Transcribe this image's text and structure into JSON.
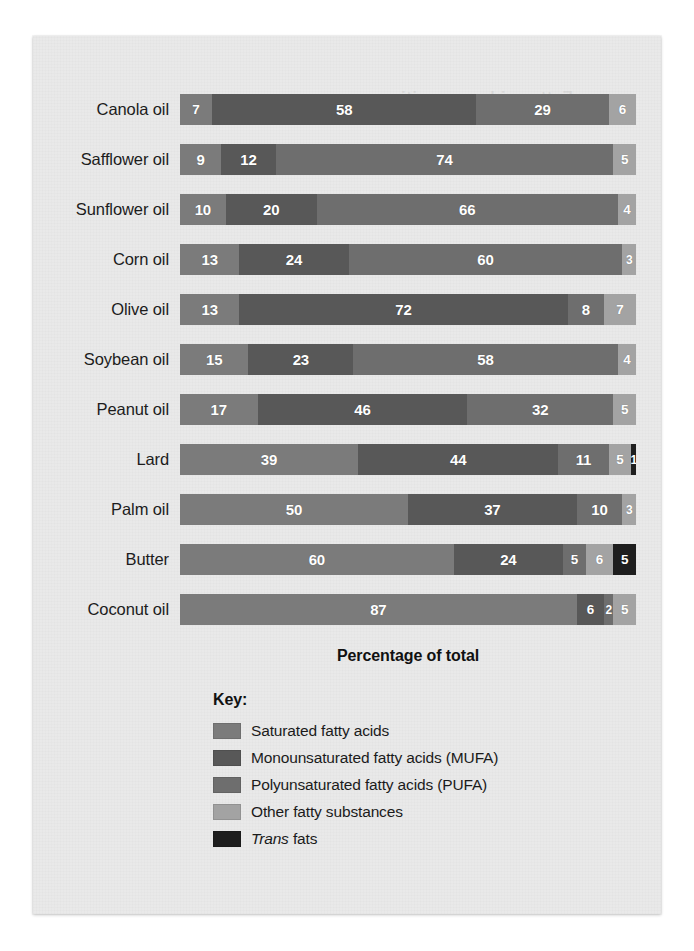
{
  "card": {
    "bleed_through_text": "Fatty acid composition"
  },
  "axis": {
    "caption": "Percentage of total"
  },
  "legend": {
    "title": "Key:",
    "items": [
      {
        "label": "Saturated fatty acids",
        "color": "#7b7b7b",
        "key": "saturated"
      },
      {
        "label": "Monounsaturated fatty acids (MUFA)",
        "color": "#585858",
        "key": "mufa"
      },
      {
        "label": "Polyunsaturated fatty acids (PUFA)",
        "color": "#6e6e6e",
        "key": "pufa"
      },
      {
        "label": "Other fatty substances",
        "color": "#a3a3a3",
        "key": "other"
      },
      {
        "label": "Trans fats",
        "color": "#1e1e1e",
        "key": "trans",
        "italic_first_word": "Trans"
      }
    ]
  },
  "chart_data": {
    "type": "bar",
    "orientation": "horizontal",
    "stacked": true,
    "title": "",
    "xlabel": "Percentage of total",
    "ylabel": "",
    "xlim": [
      0,
      100
    ],
    "grid": false,
    "legend_position": "bottom-left",
    "value_labels": true,
    "categories": [
      "Canola oil",
      "Safflower oil",
      "Sunflower oil",
      "Corn oil",
      "Olive oil",
      "Soybean oil",
      "Peanut oil",
      "Lard",
      "Palm oil",
      "Butter",
      "Coconut oil"
    ],
    "series": [
      {
        "name": "Saturated fatty acids",
        "color": "#7b7b7b",
        "values": [
          7,
          9,
          10,
          13,
          13,
          15,
          17,
          39,
          50,
          60,
          87
        ]
      },
      {
        "name": "Monounsaturated fatty acids (MUFA)",
        "color": "#585858",
        "values": [
          58,
          12,
          20,
          24,
          72,
          23,
          46,
          44,
          37,
          24,
          6
        ]
      },
      {
        "name": "Polyunsaturated fatty acids (PUFA)",
        "color": "#6e6e6e",
        "values": [
          29,
          74,
          66,
          60,
          8,
          58,
          32,
          11,
          10,
          5,
          2
        ]
      },
      {
        "name": "Other fatty substances",
        "color": "#a3a3a3",
        "values": [
          6,
          5,
          4,
          3,
          7,
          4,
          5,
          5,
          3,
          6,
          5
        ]
      },
      {
        "name": "Trans fats",
        "color": "#1e1e1e",
        "values": [
          0,
          0,
          0,
          0,
          0,
          0,
          0,
          1,
          0,
          5,
          0
        ]
      }
    ],
    "rows": [
      {
        "label": "Canola oil",
        "segments": [
          {
            "series": "saturated",
            "value": 7
          },
          {
            "series": "mufa",
            "value": 58
          },
          {
            "series": "pufa",
            "value": 29
          },
          {
            "series": "other",
            "value": 6
          }
        ]
      },
      {
        "label": "Safflower oil",
        "segments": [
          {
            "series": "saturated",
            "value": 9
          },
          {
            "series": "mufa",
            "value": 12
          },
          {
            "series": "pufa",
            "value": 74
          },
          {
            "series": "other",
            "value": 5
          }
        ]
      },
      {
        "label": "Sunflower oil",
        "segments": [
          {
            "series": "saturated",
            "value": 10
          },
          {
            "series": "mufa",
            "value": 20
          },
          {
            "series": "pufa",
            "value": 66
          },
          {
            "series": "other",
            "value": 4
          }
        ]
      },
      {
        "label": "Corn oil",
        "segments": [
          {
            "series": "saturated",
            "value": 13
          },
          {
            "series": "mufa",
            "value": 24
          },
          {
            "series": "pufa",
            "value": 60
          },
          {
            "series": "other",
            "value": 3
          }
        ]
      },
      {
        "label": "Olive oil",
        "segments": [
          {
            "series": "saturated",
            "value": 13
          },
          {
            "series": "mufa",
            "value": 72
          },
          {
            "series": "pufa",
            "value": 8
          },
          {
            "series": "other",
            "value": 7
          }
        ]
      },
      {
        "label": "Soybean oil",
        "segments": [
          {
            "series": "saturated",
            "value": 15
          },
          {
            "series": "mufa",
            "value": 23
          },
          {
            "series": "pufa",
            "value": 58
          },
          {
            "series": "other",
            "value": 4
          }
        ]
      },
      {
        "label": "Peanut oil",
        "segments": [
          {
            "series": "saturated",
            "value": 17
          },
          {
            "series": "mufa",
            "value": 46
          },
          {
            "series": "pufa",
            "value": 32
          },
          {
            "series": "other",
            "value": 5
          }
        ]
      },
      {
        "label": "Lard",
        "segments": [
          {
            "series": "saturated",
            "value": 39
          },
          {
            "series": "mufa",
            "value": 44
          },
          {
            "series": "pufa",
            "value": 11
          },
          {
            "series": "other",
            "value": 5
          },
          {
            "series": "trans",
            "value": 1
          }
        ]
      },
      {
        "label": "Palm oil",
        "segments": [
          {
            "series": "saturated",
            "value": 50
          },
          {
            "series": "mufa",
            "value": 37
          },
          {
            "series": "pufa",
            "value": 10
          },
          {
            "series": "other",
            "value": 3
          }
        ]
      },
      {
        "label": "Butter",
        "segments": [
          {
            "series": "saturated",
            "value": 60
          },
          {
            "series": "mufa",
            "value": 24
          },
          {
            "series": "pufa",
            "value": 5
          },
          {
            "series": "other",
            "value": 6
          },
          {
            "series": "trans",
            "value": 5
          }
        ]
      },
      {
        "label": "Coconut oil",
        "segments": [
          {
            "series": "saturated",
            "value": 87
          },
          {
            "series": "mufa",
            "value": 6
          },
          {
            "series": "pufa",
            "value": 2
          },
          {
            "series": "other",
            "value": 5
          }
        ]
      }
    ]
  }
}
